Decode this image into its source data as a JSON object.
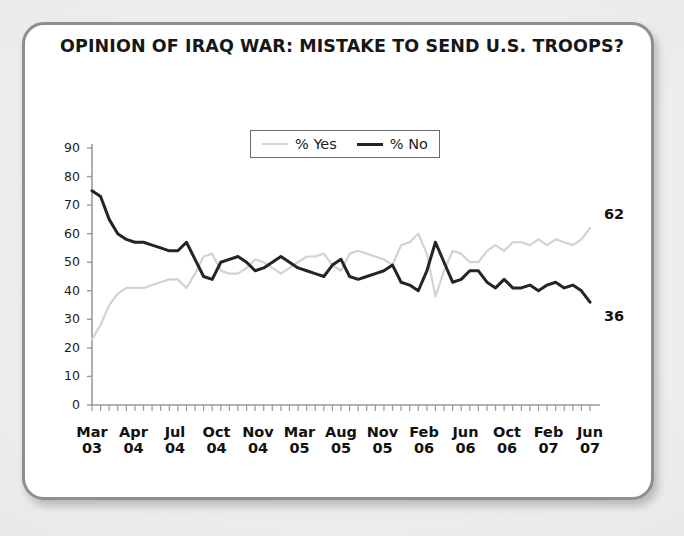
{
  "card": {
    "title": "OPINION OF IRAQ WAR: MISTAKE TO SEND U.S. TROOPS?",
    "border_color": "#8e8e8e",
    "background": "#ffffff"
  },
  "legend": {
    "position": "top-center-inside",
    "items": [
      {
        "label": "% Yes",
        "color": "#d2d2d2"
      },
      {
        "label": "% No",
        "color": "#242424"
      }
    ]
  },
  "annotations": {
    "yes_end_value": "62",
    "no_end_value": "36"
  },
  "chart_data": {
    "type": "line",
    "title": "OPINION OF IRAQ WAR: MISTAKE TO SEND U.S. TROOPS?",
    "xlabel": "",
    "ylabel": "",
    "ylim": [
      0,
      90
    ],
    "yticks": [
      0,
      10,
      20,
      30,
      40,
      50,
      60,
      70,
      80,
      90
    ],
    "grid": false,
    "legend_position": "top-center",
    "xtick_labels": [
      {
        "month": "Mar",
        "year": "03"
      },
      {
        "month": "Apr",
        "year": "04"
      },
      {
        "month": "Jul",
        "year": "04"
      },
      {
        "month": "Oct",
        "year": "04"
      },
      {
        "month": "Nov",
        "year": "04"
      },
      {
        "month": "Mar",
        "year": "05"
      },
      {
        "month": "Aug",
        "year": "05"
      },
      {
        "month": "Nov",
        "year": "05"
      },
      {
        "month": "Feb",
        "year": "06"
      },
      {
        "month": "Jun",
        "year": "06"
      },
      {
        "month": "Oct",
        "year": "06"
      },
      {
        "month": "Feb",
        "year": "07"
      },
      {
        "month": "Jun",
        "year": "07"
      }
    ],
    "n_points": 59,
    "series": [
      {
        "name": "% Yes",
        "color": "#d2d2d2",
        "end_label": "62",
        "values": [
          23,
          28,
          35,
          39,
          41,
          41,
          41,
          42,
          43,
          44,
          44,
          41,
          46,
          52,
          53,
          47,
          46,
          46,
          48,
          51,
          50,
          48,
          46,
          48,
          50,
          52,
          52,
          53,
          49,
          47,
          53,
          54,
          53,
          52,
          51,
          49,
          56,
          57,
          60,
          53,
          38,
          47,
          54,
          53,
          50,
          50,
          54,
          56,
          54,
          57,
          57,
          56,
          58,
          56,
          58,
          57,
          56,
          58,
          62
        ]
      },
      {
        "name": "% No",
        "color": "#242424",
        "end_label": "36",
        "values": [
          75,
          73,
          65,
          60,
          58,
          57,
          57,
          56,
          55,
          54,
          54,
          57,
          51,
          45,
          44,
          50,
          51,
          52,
          50,
          47,
          48,
          50,
          52,
          50,
          48,
          47,
          46,
          45,
          49,
          51,
          45,
          44,
          45,
          46,
          47,
          49,
          43,
          42,
          40,
          47,
          57,
          50,
          43,
          44,
          47,
          47,
          43,
          41,
          44,
          41,
          41,
          42,
          40,
          42,
          43,
          41,
          42,
          40,
          36
        ]
      }
    ]
  }
}
